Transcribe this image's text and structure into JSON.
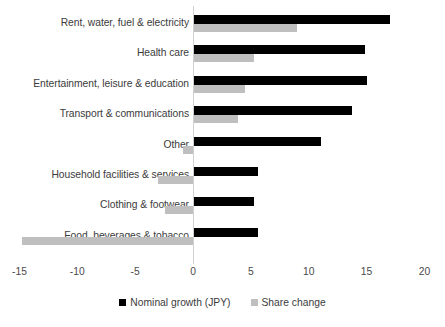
{
  "chart_data": {
    "type": "bar",
    "orientation": "horizontal",
    "title": "",
    "subtitle": "",
    "xlabel": "",
    "ylabel": "",
    "xlim": [
      -15,
      20
    ],
    "xticks": [
      -15,
      -10,
      -5,
      0,
      5,
      10,
      15,
      20
    ],
    "xtick_labels": [
      "-15",
      "-10",
      "-5",
      "0",
      "5",
      "10",
      "15",
      "20"
    ],
    "grid": false,
    "legend_position": "bottom",
    "categories": [
      "Rent, water, fuel & electricity",
      "Health care",
      "Entertainment, leisure & education",
      "Transport & communications",
      "Other",
      "Household facilities & services",
      "Clothing & footwear",
      "Food, beverages & tobacco"
    ],
    "series": [
      {
        "name": "Nominal growth (JPY)",
        "color": "#000000",
        "values": [
          17.0,
          14.9,
          15.0,
          13.7,
          11.1,
          5.6,
          5.3,
          5.6
        ]
      },
      {
        "name": "Share change",
        "color": "#bfbfbf",
        "values": [
          9.0,
          5.3,
          4.5,
          3.9,
          -0.9,
          -3.0,
          -2.4,
          -14.8
        ]
      }
    ]
  },
  "legend": {
    "items": [
      {
        "label": "Nominal growth (JPY)",
        "color": "#000000"
      },
      {
        "label": "Share change",
        "color": "#bfbfbf"
      }
    ]
  }
}
